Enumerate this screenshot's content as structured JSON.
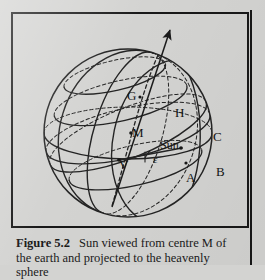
{
  "figure": {
    "caption_label": "Figure 5.2",
    "caption_text": "Sun viewed from centre M of the earth and projected to the heavenly sphere",
    "frame_color": "#181818",
    "background_color": "#d3d3d1",
    "line_color": "#222222"
  },
  "diagram": {
    "type": "celestial-sphere",
    "sphere": {
      "cx": 128,
      "cy": 133,
      "r": 84
    },
    "arrow": {
      "label": "polar-axis-arrow",
      "from_x": 112,
      "from_y": 205,
      "to_x": 170,
      "to_y": 27
    },
    "labels": [
      {
        "name": "G",
        "text": "G",
        "x": 127,
        "y": 89
      },
      {
        "name": "H",
        "text": "H",
        "x": 175,
        "y": 106
      },
      {
        "name": "M",
        "text": "M",
        "x": 132,
        "y": 126
      },
      {
        "name": "Sun",
        "text": "Sun",
        "x": 160,
        "y": 139
      },
      {
        "name": "C",
        "text": "C",
        "x": 213,
        "y": 130
      },
      {
        "name": "epsilon",
        "text": "ε",
        "x": 153,
        "y": 154
      },
      {
        "name": "V",
        "text": "V",
        "x": 119,
        "y": 158
      },
      {
        "name": "A",
        "text": "A",
        "x": 186,
        "y": 171
      },
      {
        "name": "B",
        "text": "B",
        "x": 216,
        "y": 165
      }
    ],
    "points_marked": [
      "M",
      "V",
      "Sun",
      "G",
      "A"
    ]
  }
}
